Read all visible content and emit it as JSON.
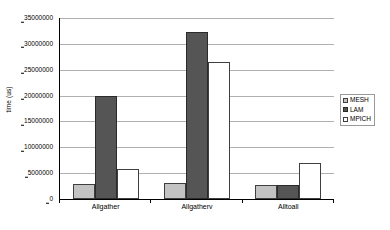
{
  "chart_data": {
    "type": "bar",
    "title": "",
    "subtitle": "",
    "xlabel": "",
    "ylabel": "time (us)",
    "categories": [
      "Allgather",
      "Allgatherv",
      "Alltoall"
    ],
    "series": [
      {
        "name": "MESH",
        "color": "#c3c3c3",
        "values": [
          3000000,
          3100000,
          2700000
        ]
      },
      {
        "name": "LAM",
        "color": "#555555",
        "values": [
          20000000,
          32200000,
          2700000
        ]
      },
      {
        "name": "MPICH",
        "color": "#ffffff",
        "values": [
          5750000,
          26500000,
          7000000
        ]
      }
    ],
    "ylim": [
      0,
      35000000
    ],
    "ytick_step": 5000000,
    "ytick_labels": [
      "35000000",
      "30000000",
      "25000000",
      "20000000",
      "15000000",
      "10000000",
      "5000000",
      "0"
    ],
    "grid": true,
    "grid_axis": "y",
    "grid_color": "#b0b0b0",
    "legend_position": "right",
    "axis_color": "#000000",
    "background": "#ffffff"
  }
}
